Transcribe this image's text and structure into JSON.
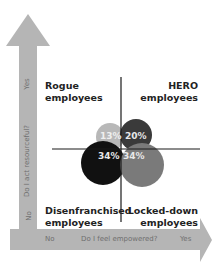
{
  "diagram": {
    "y_axis": {
      "question": "Do I act resourceful?",
      "yes": "Yes",
      "no": "No"
    },
    "x_axis": {
      "question": "Do I feel empowered?",
      "yes": "Yes",
      "no": "No"
    },
    "quadrants": {
      "top_left": {
        "line1": "Rogue",
        "line2": "employees"
      },
      "top_right": {
        "line1": "HERO",
        "line2": "employees"
      },
      "bottom_left": {
        "line1": "Disenfranchised",
        "line2": "employees"
      },
      "bottom_right": {
        "line1": "Locked-down",
        "line2": "employees"
      }
    },
    "segments": [
      {
        "quadrant": "Rogue",
        "value": "13%",
        "color": "#b8b8b8"
      },
      {
        "quadrant": "HERO",
        "value": "20%",
        "color": "#3a3a3a"
      },
      {
        "quadrant": "Disenfranchised",
        "value": "34%",
        "color": "#111111"
      },
      {
        "quadrant": "Locked-down",
        "value": "34%",
        "color": "#7a7a7a"
      }
    ],
    "colors": {
      "arrow": "#b5b5b5",
      "crosshair": "#1a1a1a"
    }
  }
}
